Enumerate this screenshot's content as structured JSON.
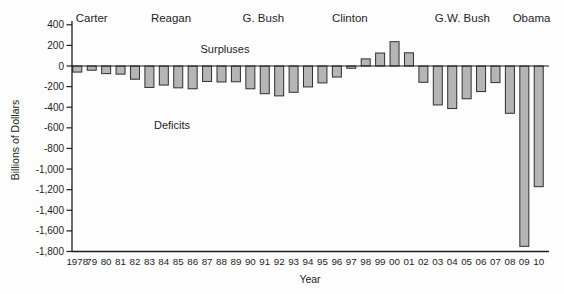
{
  "chart_data": {
    "type": "bar",
    "title": "",
    "xlabel": "Year",
    "ylabel": "Billions of Dollars",
    "x": [
      1978,
      1979,
      1980,
      1981,
      1982,
      1983,
      1984,
      1985,
      1986,
      1987,
      1988,
      1989,
      1990,
      1991,
      1992,
      1993,
      1994,
      1995,
      1996,
      1997,
      1998,
      1999,
      2000,
      2001,
      2002,
      2003,
      2004,
      2005,
      2006,
      2007,
      2008,
      2009,
      2010
    ],
    "x_tick_labels": [
      "1978",
      "79",
      "80",
      "81",
      "82",
      "83",
      "84",
      "85",
      "86",
      "87",
      "88",
      "89",
      "90",
      "91",
      "92",
      "93",
      "94",
      "95",
      "96",
      "97",
      "98",
      "99",
      "00",
      "01",
      "02",
      "03",
      "04",
      "05",
      "06",
      "07",
      "08",
      "09",
      "10"
    ],
    "values": [
      -59,
      -41,
      -74,
      -79,
      -128,
      -208,
      -185,
      -212,
      -221,
      -150,
      -155,
      -153,
      -221,
      -269,
      -290,
      -255,
      -203,
      -164,
      -107,
      -22,
      69,
      126,
      236,
      128,
      -158,
      -378,
      -413,
      -318,
      -248,
      -161,
      -459,
      -1750,
      -1171
    ],
    "ylim": [
      -1800,
      400
    ],
    "y_ticks": [
      400,
      200,
      0,
      -200,
      -400,
      -600,
      -800,
      -1000,
      -1200,
      -1400,
      -1600,
      -1800
    ],
    "y_tick_labels": [
      "400",
      "200",
      "0",
      "-200",
      "-400",
      "-600",
      "-800",
      "-1,000",
      "-1,200",
      "-1,400",
      "-1,600",
      "-1,800"
    ],
    "grid": false,
    "legend": "none",
    "annotations": [
      {
        "name": "surpluses",
        "label": "Surpluses",
        "x_px": 225,
        "y_px": 49
      },
      {
        "name": "deficits",
        "label": "Deficits",
        "x_px": 172,
        "y_px": 125
      }
    ],
    "era_labels": [
      {
        "name": "carter",
        "label": "Carter",
        "center_year": 1979
      },
      {
        "name": "reagan",
        "label": "Reagan",
        "center_year": 1984.5
      },
      {
        "name": "g-bush",
        "label": "G. Bush",
        "center_year": 1990.9
      },
      {
        "name": "clinton",
        "label": "Clinton",
        "center_year": 1996.9
      },
      {
        "name": "gw-bush",
        "label": "G.W. Bush",
        "center_year": 2004.7
      },
      {
        "name": "obama",
        "label": "Obama",
        "center_year": 2009.5
      }
    ],
    "colors": {
      "bar_fill": "#b5b5b5",
      "bar_border": "#2f2f2f",
      "axis": "#1d1d1d",
      "text": "#1d1d1d",
      "background": "#fdfdfd"
    }
  }
}
